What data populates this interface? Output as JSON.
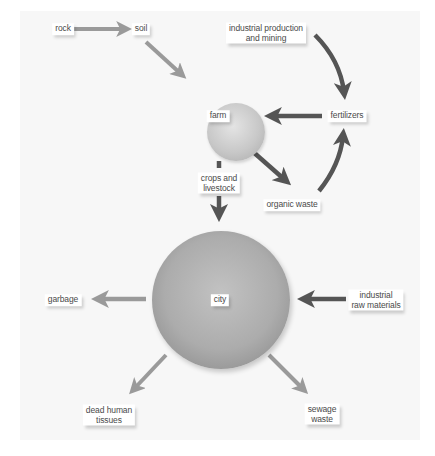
{
  "diagram": {
    "type": "flow-diagram",
    "nodes": {
      "rock": "rock",
      "soil": "soil",
      "industrial_production": [
        "industrial production",
        "and mining"
      ],
      "farm": "farm",
      "fertilizers": "fertilizers",
      "organic_waste": "organic waste",
      "crops": [
        "crops and",
        "livestock"
      ],
      "city": "city",
      "garbage": "garbage",
      "industrial_raw": [
        "industrial",
        "raw materials"
      ],
      "dead_tissues": [
        "dead human",
        "tissues"
      ],
      "sewage": [
        "sewage",
        "waste"
      ]
    },
    "edges": [
      {
        "from": "rock",
        "to": "soil",
        "color": "#9a9a9a"
      },
      {
        "from": "soil",
        "to": "farm",
        "color": "#9a9a9a"
      },
      {
        "from": "industrial production and mining",
        "to": "fertilizers",
        "color": "#555555"
      },
      {
        "from": "fertilizers",
        "to": "farm",
        "color": "#555555"
      },
      {
        "from": "farm",
        "to": "organic waste",
        "color": "#555555"
      },
      {
        "from": "organic waste",
        "to": "fertilizers",
        "color": "#555555"
      },
      {
        "from": "farm",
        "to": "city",
        "via": "crops and livestock",
        "color": "#555555"
      },
      {
        "from": "industrial raw materials",
        "to": "city",
        "color": "#555555"
      },
      {
        "from": "city",
        "to": "garbage",
        "color": "#9a9a9a"
      },
      {
        "from": "city",
        "to": "dead human tissues",
        "color": "#9a9a9a"
      },
      {
        "from": "city",
        "to": "sewage waste",
        "color": "#9a9a9a"
      }
    ],
    "colors": {
      "panel_bg": "#f7f7f7",
      "light_arrow": "#9a9a9a",
      "dark_arrow": "#555555",
      "label_bg": "#ffffff",
      "label_text": "#4a4a4a"
    }
  }
}
